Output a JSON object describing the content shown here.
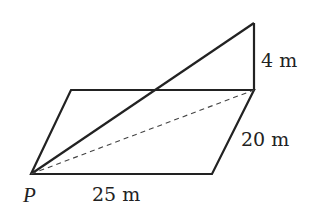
{
  "diagram": {
    "type": "3d-geometry-inclined-plane",
    "vertices": {
      "P": [
        31,
        174
      ],
      "front_right": [
        212,
        174
      ],
      "back_right": [
        254,
        90
      ],
      "back_left": [
        71,
        90
      ],
      "top": [
        254,
        23
      ]
    },
    "labels": {
      "point_p": "P",
      "base_length": "25 m",
      "side_length": "20 m",
      "height": "4 m"
    },
    "colors": {
      "stroke": "#222222",
      "background": "#ffffff"
    }
  }
}
